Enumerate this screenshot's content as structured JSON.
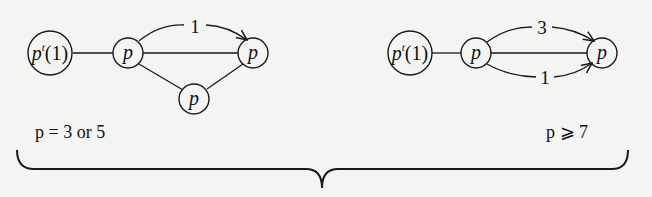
{
  "diagram": {
    "left_graph": {
      "caption": "p = 3 or 5",
      "nodes": [
        {
          "id": "root",
          "label_base": "p",
          "label_sup": "t",
          "label_rest": "(1)"
        },
        {
          "id": "a",
          "label": "p"
        },
        {
          "id": "b",
          "label": "p"
        },
        {
          "id": "c",
          "label": "p"
        }
      ],
      "edges": [
        {
          "from": "root",
          "to": "a"
        },
        {
          "from": "a",
          "to": "b"
        },
        {
          "from": "a",
          "to": "b",
          "curved": true,
          "arrow": true,
          "label": "1"
        },
        {
          "from": "a",
          "to": "c"
        },
        {
          "from": "c",
          "to": "b"
        }
      ]
    },
    "right_graph": {
      "caption": "p ⩾ 7",
      "nodes": [
        {
          "id": "root",
          "label_base": "p",
          "label_sup": "t",
          "label_rest": "(1)"
        },
        {
          "id": "a",
          "label": "p"
        },
        {
          "id": "b",
          "label": "p"
        }
      ],
      "edges": [
        {
          "from": "root",
          "to": "a"
        },
        {
          "from": "a",
          "to": "b"
        },
        {
          "from": "a",
          "to": "b",
          "curved": "upper",
          "arrow": true,
          "label": "3"
        },
        {
          "from": "a",
          "to": "b",
          "curved": "lower",
          "arrow": true,
          "label": "1"
        }
      ]
    },
    "brace": "underbrace spanning both graphs"
  }
}
